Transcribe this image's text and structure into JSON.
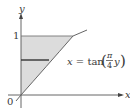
{
  "diagram": {
    "axes": {
      "x_label": "x",
      "y_label": "y",
      "origin_label": "0",
      "y_tick_label": "1"
    },
    "curve": {
      "equation_lhs": "x = tan",
      "fraction_num": "π",
      "fraction_den": "4",
      "equation_var": "y"
    },
    "colors": {
      "shade": "#dcdcdc",
      "axis": "#555555",
      "curve": "#666666",
      "strip": "#333333"
    }
  }
}
